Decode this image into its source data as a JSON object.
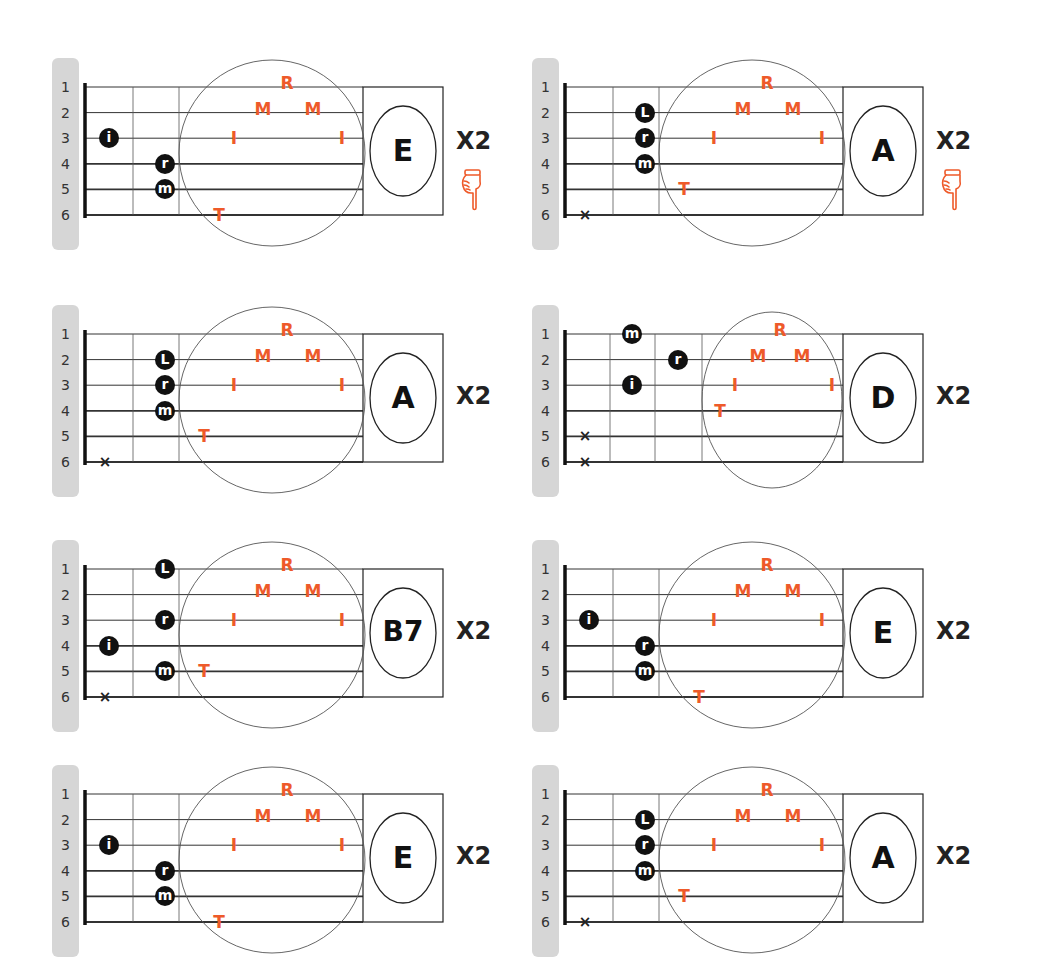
{
  "string_numbers": [
    "1",
    "2",
    "3",
    "4",
    "5",
    "6"
  ],
  "colors": {
    "pluck_accent": "#ee5a2a",
    "finger_dot": "#111111",
    "label_bar": "#d6d6d6"
  },
  "pluck_pattern_legend": {
    "T": "thumb",
    "I": "index",
    "M": "middle",
    "R": "ring"
  },
  "diagrams": [
    {
      "chord": "E",
      "repeat": "X2",
      "hand_icon": true,
      "fingers": [
        {
          "label": "i",
          "string": 3,
          "fret": 1
        },
        {
          "label": "r",
          "string": 4,
          "fret": 2
        },
        {
          "label": "m",
          "string": 5,
          "fret": 2
        }
      ],
      "muted": [],
      "pluck": [
        {
          "l": "T",
          "s": 6
        },
        {
          "l": "I",
          "s": 3
        },
        {
          "l": "M",
          "s": 2
        },
        {
          "l": "R",
          "s": 1
        },
        {
          "l": "M",
          "s": 2
        },
        {
          "l": "I",
          "s": 3
        }
      ]
    },
    {
      "chord": "A",
      "repeat": "X2",
      "hand_icon": true,
      "fingers": [
        {
          "label": "L",
          "string": 2,
          "fret": 2
        },
        {
          "label": "r",
          "string": 3,
          "fret": 2
        },
        {
          "label": "m",
          "string": 4,
          "fret": 2
        }
      ],
      "muted": [
        6
      ],
      "pluck": [
        {
          "l": "T",
          "s": 5
        },
        {
          "l": "I",
          "s": 3
        },
        {
          "l": "M",
          "s": 2
        },
        {
          "l": "R",
          "s": 1
        },
        {
          "l": "M",
          "s": 2
        },
        {
          "l": "I",
          "s": 3
        }
      ]
    },
    {
      "chord": "A",
      "repeat": "X2",
      "hand_icon": false,
      "fingers": [
        {
          "label": "L",
          "string": 2,
          "fret": 2
        },
        {
          "label": "r",
          "string": 3,
          "fret": 2
        },
        {
          "label": "m",
          "string": 4,
          "fret": 2
        }
      ],
      "muted": [
        6
      ],
      "pluck": [
        {
          "l": "T",
          "s": 5
        },
        {
          "l": "I",
          "s": 3
        },
        {
          "l": "M",
          "s": 2
        },
        {
          "l": "R",
          "s": 1
        },
        {
          "l": "M",
          "s": 2
        },
        {
          "l": "I",
          "s": 3
        }
      ]
    },
    {
      "chord": "D",
      "repeat": "X2",
      "hand_icon": false,
      "fingers": [
        {
          "label": "m",
          "string": 1,
          "fret": 2
        },
        {
          "label": "r",
          "string": 2,
          "fret": 3
        },
        {
          "label": "i",
          "string": 3,
          "fret": 2
        }
      ],
      "muted": [
        5,
        6
      ],
      "pluck": [
        {
          "l": "T",
          "s": 4
        },
        {
          "l": "I",
          "s": 3
        },
        {
          "l": "M",
          "s": 2
        },
        {
          "l": "R",
          "s": 1
        },
        {
          "l": "M",
          "s": 2
        },
        {
          "l": "I",
          "s": 3
        }
      ]
    },
    {
      "chord": "B7",
      "repeat": "X2",
      "hand_icon": false,
      "fingers": [
        {
          "label": "L",
          "string": 1,
          "fret": 2
        },
        {
          "label": "r",
          "string": 3,
          "fret": 2
        },
        {
          "label": "i",
          "string": 4,
          "fret": 1
        },
        {
          "label": "m",
          "string": 5,
          "fret": 2
        }
      ],
      "muted": [
        6
      ],
      "pluck": [
        {
          "l": "T",
          "s": 5
        },
        {
          "l": "I",
          "s": 3
        },
        {
          "l": "M",
          "s": 2
        },
        {
          "l": "R",
          "s": 1
        },
        {
          "l": "M",
          "s": 2
        },
        {
          "l": "I",
          "s": 3
        }
      ]
    },
    {
      "chord": "E",
      "repeat": "X2",
      "hand_icon": false,
      "fingers": [
        {
          "label": "i",
          "string": 3,
          "fret": 1
        },
        {
          "label": "r",
          "string": 4,
          "fret": 2
        },
        {
          "label": "m",
          "string": 5,
          "fret": 2
        }
      ],
      "muted": [],
      "pluck": [
        {
          "l": "T",
          "s": 6
        },
        {
          "l": "I",
          "s": 3
        },
        {
          "l": "M",
          "s": 2
        },
        {
          "l": "R",
          "s": 1
        },
        {
          "l": "M",
          "s": 2
        },
        {
          "l": "I",
          "s": 3
        }
      ]
    },
    {
      "chord": "E",
      "repeat": "X2",
      "hand_icon": false,
      "fingers": [
        {
          "label": "i",
          "string": 3,
          "fret": 1
        },
        {
          "label": "r",
          "string": 4,
          "fret": 2
        },
        {
          "label": "m",
          "string": 5,
          "fret": 2
        }
      ],
      "muted": [],
      "pluck": [
        {
          "l": "T",
          "s": 6
        },
        {
          "l": "I",
          "s": 3
        },
        {
          "l": "M",
          "s": 2
        },
        {
          "l": "R",
          "s": 1
        },
        {
          "l": "M",
          "s": 2
        },
        {
          "l": "I",
          "s": 3
        }
      ]
    },
    {
      "chord": "A",
      "repeat": "X2",
      "hand_icon": false,
      "fingers": [
        {
          "label": "L",
          "string": 2,
          "fret": 2
        },
        {
          "label": "r",
          "string": 3,
          "fret": 2
        },
        {
          "label": "m",
          "string": 4,
          "fret": 2
        }
      ],
      "muted": [
        6
      ],
      "pluck": [
        {
          "l": "T",
          "s": 5
        },
        {
          "l": "I",
          "s": 3
        },
        {
          "l": "M",
          "s": 2
        },
        {
          "l": "R",
          "s": 1
        },
        {
          "l": "M",
          "s": 2
        },
        {
          "l": "I",
          "s": 3
        }
      ]
    }
  ]
}
